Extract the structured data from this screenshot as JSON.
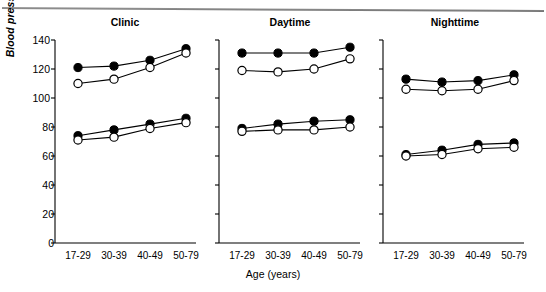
{
  "figure": {
    "y_axis_label": "Blood pressure (mm Hg)",
    "x_axis_label": "Age (years)"
  },
  "axis": {
    "y_ticks": [
      "0",
      "20",
      "40",
      "60",
      "80",
      "100",
      "120",
      "140"
    ],
    "x_ticks": [
      "17-29",
      "30-39",
      "40-49",
      "50-79"
    ]
  },
  "panels": {
    "clinic": {
      "title": "Clinic"
    },
    "daytime": {
      "title": "Daytime"
    },
    "nighttime": {
      "title": "Nighttime"
    }
  },
  "chart_data": {
    "type": "line",
    "title": "",
    "xlabel": "Age (years)",
    "ylabel": "Blood pressure (mm Hg)",
    "ylim": [
      0,
      140
    ],
    "yticks": [
      0,
      20,
      40,
      60,
      80,
      100,
      120,
      140
    ],
    "grid": false,
    "legend": "none",
    "categories": [
      "17-29",
      "30-39",
      "40-49",
      "50-79"
    ],
    "panels": [
      {
        "name": "Clinic",
        "series": [
          {
            "name": "Systolic - filled circle",
            "marker": "filled-circle",
            "values": [
              121,
              122,
              126,
              134
            ]
          },
          {
            "name": "Systolic - open circle",
            "marker": "open-circle",
            "values": [
              110,
              113,
              121,
              131
            ]
          },
          {
            "name": "Diastolic - filled circle",
            "marker": "filled-circle",
            "values": [
              74,
              78,
              82,
              86
            ]
          },
          {
            "name": "Diastolic - open circle",
            "marker": "open-circle",
            "values": [
              71,
              73,
              79,
              83
            ]
          }
        ]
      },
      {
        "name": "Daytime",
        "series": [
          {
            "name": "Systolic - filled circle",
            "marker": "filled-circle",
            "values": [
              131,
              131,
              131,
              135
            ]
          },
          {
            "name": "Systolic - open circle",
            "marker": "open-circle",
            "values": [
              119,
              118,
              120,
              127
            ]
          },
          {
            "name": "Diastolic - filled circle",
            "marker": "filled-circle",
            "values": [
              79,
              82,
              84,
              85
            ]
          },
          {
            "name": "Diastolic - open circle",
            "marker": "open-circle",
            "values": [
              77,
              78,
              78,
              80
            ]
          }
        ]
      },
      {
        "name": "Nighttime",
        "series": [
          {
            "name": "Systolic - filled circle",
            "marker": "filled-circle",
            "values": [
              113,
              111,
              112,
              116
            ]
          },
          {
            "name": "Systolic - open circle",
            "marker": "open-circle",
            "values": [
              106,
              105,
              106,
              112
            ]
          },
          {
            "name": "Diastolic - filled circle",
            "marker": "filled-circle",
            "values": [
              61,
              64,
              68,
              69
            ]
          },
          {
            "name": "Diastolic - open circle",
            "marker": "open-circle",
            "values": [
              60,
              61,
              65,
              66
            ]
          }
        ]
      }
    ]
  },
  "colors": {
    "line": "#000000",
    "marker_fill": "#000000",
    "marker_open": "#ffffff",
    "background": "#ffffff"
  }
}
